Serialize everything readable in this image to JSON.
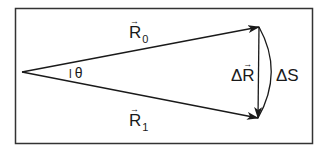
{
  "diagram": {
    "colors": {
      "stroke": "#1a1a1a",
      "background": "#ffffff",
      "frame": "#333333"
    },
    "frame": {
      "x": 15,
      "y": 8,
      "width": 298,
      "height": 136
    },
    "origin": {
      "x": 22,
      "y": 72
    },
    "vectors": {
      "R0": {
        "tip": {
          "x": 259,
          "y": 27
        }
      },
      "R1": {
        "tip": {
          "x": 258,
          "y": 118
        }
      },
      "deltaR": {
        "from": {
          "x": 259,
          "y": 27
        },
        "to": {
          "x": 258,
          "y": 118
        }
      }
    },
    "arc": {
      "from": {
        "x": 259,
        "y": 27
      },
      "to": {
        "x": 258,
        "y": 118
      },
      "bulge_x": 272
    }
  },
  "labels": {
    "r0": {
      "base": "R",
      "sub": "0",
      "arrow": "→"
    },
    "r1": {
      "base": "R",
      "sub": "1",
      "arrow": "→"
    },
    "theta": {
      "tick": "l",
      "symbol": "θ"
    },
    "delta_r": {
      "delta": "Δ",
      "base": "R",
      "arrow": "→"
    },
    "delta_s": {
      "text": "ΔS"
    }
  }
}
